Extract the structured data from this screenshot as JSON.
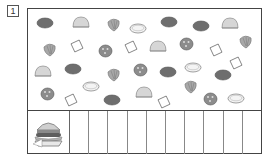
{
  "worksheet": {
    "problem_number": "1",
    "instruction_icon": "hamburger-icon",
    "count_boxes": 10
  },
  "palette": {
    "frame": "#444444",
    "patty": "#6e6e6e",
    "bun": "#d6d6d6",
    "lettuce": "#a8a8a8",
    "tomato": "#8c8c8c",
    "cheese": "#ffffff",
    "onion": "#f4f4f4"
  },
  "items": [
    {
      "type": "patty",
      "x": 44,
      "y": 22
    },
    {
      "type": "bun",
      "x": 80,
      "y": 21
    },
    {
      "type": "lettuce",
      "x": 112,
      "y": 23
    },
    {
      "type": "onion",
      "x": 137,
      "y": 27
    },
    {
      "type": "patty",
      "x": 168,
      "y": 21
    },
    {
      "type": "patty",
      "x": 200,
      "y": 25
    },
    {
      "type": "bun",
      "x": 229,
      "y": 22
    },
    {
      "type": "lettuce",
      "x": 48,
      "y": 48
    },
    {
      "type": "cheese",
      "x": 76,
      "y": 45
    },
    {
      "type": "tomato",
      "x": 104,
      "y": 50
    },
    {
      "type": "cheese",
      "x": 130,
      "y": 46
    },
    {
      "type": "bun",
      "x": 157,
      "y": 45
    },
    {
      "type": "tomato",
      "x": 185,
      "y": 43
    },
    {
      "type": "cheese",
      "x": 215,
      "y": 49
    },
    {
      "type": "lettuce",
      "x": 244,
      "y": 40
    },
    {
      "type": "bun",
      "x": 42,
      "y": 70
    },
    {
      "type": "patty",
      "x": 72,
      "y": 68
    },
    {
      "type": "lettuce",
      "x": 112,
      "y": 73
    },
    {
      "type": "tomato",
      "x": 139,
      "y": 69
    },
    {
      "type": "patty",
      "x": 167,
      "y": 71
    },
    {
      "type": "onion",
      "x": 192,
      "y": 66
    },
    {
      "type": "cheese",
      "x": 235,
      "y": 62
    },
    {
      "type": "tomato",
      "x": 46,
      "y": 93
    },
    {
      "type": "onion",
      "x": 90,
      "y": 85
    },
    {
      "type": "cheese",
      "x": 70,
      "y": 99
    },
    {
      "type": "patty",
      "x": 111,
      "y": 99
    },
    {
      "type": "bun",
      "x": 143,
      "y": 91
    },
    {
      "type": "cheese",
      "x": 163,
      "y": 101
    },
    {
      "type": "lettuce",
      "x": 189,
      "y": 85
    },
    {
      "type": "tomato",
      "x": 209,
      "y": 98
    },
    {
      "type": "patty",
      "x": 222,
      "y": 74
    },
    {
      "type": "onion",
      "x": 235,
      "y": 97
    }
  ]
}
